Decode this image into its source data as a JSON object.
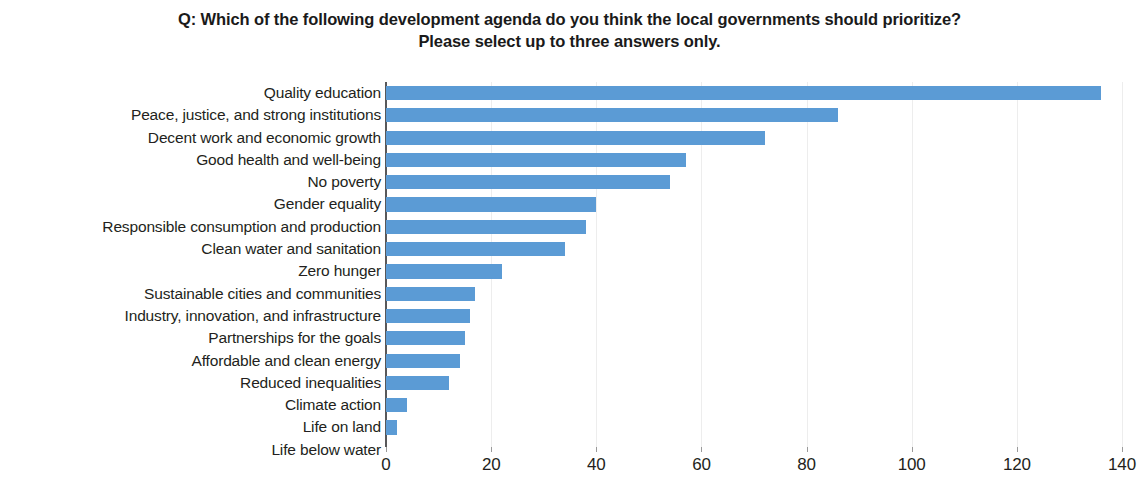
{
  "chart_data": {
    "type": "bar",
    "orientation": "horizontal",
    "title": "Q: Which of the following development agenda do you think the local governments should prioritize? Please select up to three answers only.",
    "title_lines": [
      "Q: Which of the following development agenda do you think the local governments should prioritize?",
      "Please select up to three answers only."
    ],
    "xlabel": "",
    "ylabel": "",
    "categories": [
      "Quality education",
      "Peace, justice, and strong institutions",
      "Decent work and economic growth",
      "Good health and well-being",
      "No poverty",
      "Gender equality",
      "Responsible consumption and production",
      "Clean water and sanitation",
      "Zero hunger",
      "Sustainable cities and communities",
      "Industry, innovation, and infrastructure",
      "Partnerships for the goals",
      "Affordable and clean energy",
      "Reduced inequalities",
      "Climate action",
      "Life on land",
      "Life below water"
    ],
    "values": [
      136,
      86,
      72,
      57,
      54,
      40,
      38,
      34,
      22,
      17,
      16,
      15,
      14,
      12,
      4,
      2,
      0
    ],
    "xlim": [
      0,
      140
    ],
    "xticks": [
      0,
      20,
      40,
      60,
      80,
      100,
      120,
      140
    ],
    "xtick_labels": [
      "0",
      "20",
      "40",
      "60",
      "80",
      "100",
      "120",
      "140"
    ],
    "grid": true,
    "grid_axis": "x",
    "legend": false,
    "bar_color": "#5b9bd5",
    "axis_color": "#58585a",
    "grid_color": "#ededed",
    "text_color": "#231f20",
    "background_color": "#ffffff"
  }
}
